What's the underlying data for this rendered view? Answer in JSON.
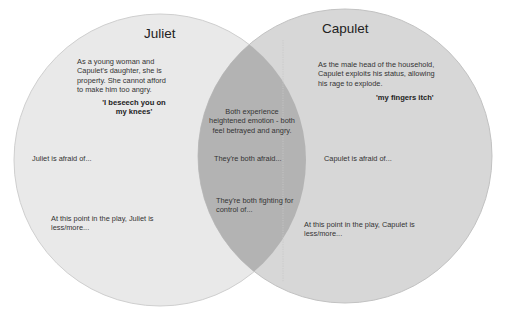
{
  "diagram": {
    "type": "venn",
    "colors": {
      "left_fill": "#e8e8e8",
      "right_fill": "#d6d6d6",
      "overlap_fill": "#b4b4b4",
      "stroke": "#c4c4c4",
      "background": "#ffffff"
    },
    "left": {
      "title": "Juliet",
      "description": [
        "As a young woman and",
        "Capulet's daughter, she is",
        "property. She cannot afford",
        "to make him too angry."
      ],
      "quote": [
        "'I beseech you on",
        "my knees'"
      ],
      "afraid": "Juliet is afraid of...",
      "point_in_play": [
        "At this point in the play, Juliet is",
        "less/more..."
      ]
    },
    "right": {
      "title": "Capulet",
      "description": [
        "As the male head of the household,",
        "Capulet exploits his status, allowing",
        "his rage to explode."
      ],
      "quote": "'my fingers itch'",
      "afraid": "Capulet is afraid of...",
      "point_in_play": [
        "At this point in the play, Capulet is",
        "less/more..."
      ]
    },
    "overlap": {
      "emotion": [
        "Both experience",
        "heightened emotion - both",
        "feel betrayed and angry."
      ],
      "afraid": "They're both afraid...",
      "fighting": [
        "They're both fighting for",
        "control of..."
      ]
    }
  }
}
